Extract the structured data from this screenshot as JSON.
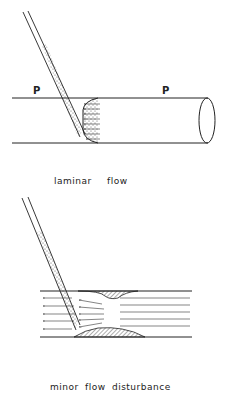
{
  "figure_top": {
    "caption": "laminar flow",
    "pressure_label_left": "P",
    "pressure_label_right": "P"
  },
  "figure_bottom": {
    "caption": "minor flow disturbance"
  },
  "colors": {
    "line": "#222222",
    "background": "#ffffff"
  }
}
